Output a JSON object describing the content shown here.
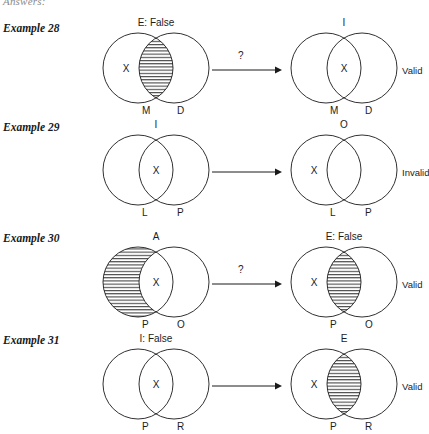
{
  "page": {
    "heading": "Answers:",
    "width": 422,
    "height": 427,
    "background": "#ffffff",
    "stroke_color": "#1a1a1a",
    "hatch_color": "#1a1a1a"
  },
  "examples": [
    {
      "label": "Example 28",
      "label_top": 22,
      "row_top": 18,
      "left_diagram": {
        "top_label": "E: False",
        "left_label": "M",
        "right_label": "D",
        "x_marker": "X",
        "x_region": "left-only",
        "shaded_region": "intersection"
      },
      "arrow": {
        "question_mark": "?"
      },
      "right_diagram": {
        "top_label": "I",
        "left_label": "M",
        "right_label": "D",
        "x_marker": "X",
        "x_region": "intersection",
        "shaded_region": "none"
      },
      "verdict": "Valid"
    },
    {
      "label": "Example 29",
      "label_top": 121,
      "row_top": 120,
      "left_diagram": {
        "top_label": "I",
        "left_label": "L",
        "right_label": "P",
        "x_marker": "X",
        "x_region": "intersection",
        "shaded_region": "none"
      },
      "arrow": {
        "question_mark": ""
      },
      "right_diagram": {
        "top_label": "O",
        "left_label": "L",
        "right_label": "P",
        "x_marker": "X",
        "x_region": "left-only",
        "shaded_region": "none"
      },
      "verdict": "Invalid"
    },
    {
      "label": "Example 30",
      "label_top": 232,
      "row_top": 232,
      "left_diagram": {
        "top_label": "A",
        "left_label": "P",
        "right_label": "O",
        "x_marker": "X",
        "x_region": "intersection",
        "shaded_region": "left-only"
      },
      "arrow": {
        "question_mark": "?"
      },
      "right_diagram": {
        "top_label": "E: False",
        "left_label": "P",
        "right_label": "O",
        "x_marker": "X",
        "x_region": "left-only",
        "shaded_region": "intersection"
      },
      "verdict": "Valid"
    },
    {
      "label": "Example 31",
      "label_top": 334,
      "row_top": 334,
      "left_diagram": {
        "top_label": "I: False",
        "left_label": "P",
        "right_label": "R",
        "x_marker": "X",
        "x_region": "intersection",
        "shaded_region": "none"
      },
      "arrow": {
        "question_mark": ""
      },
      "right_diagram": {
        "top_label": "E",
        "left_label": "P",
        "right_label": "R",
        "x_marker": "X",
        "x_region": "left-only",
        "shaded_region": "intersection"
      },
      "verdict": "Valid"
    }
  ]
}
